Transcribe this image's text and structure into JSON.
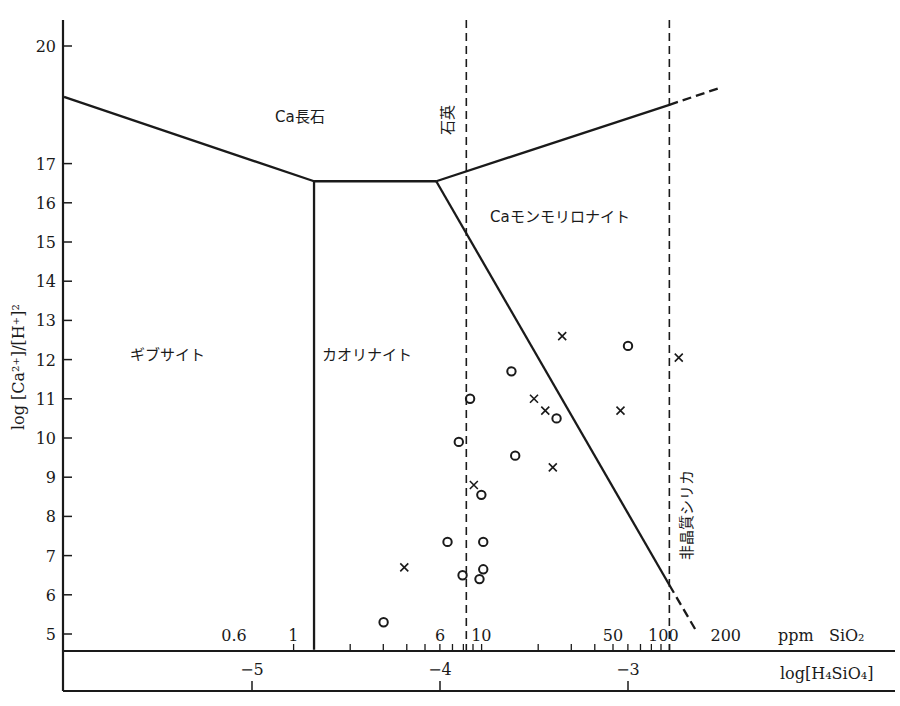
{
  "chart_data": {
    "type": "scatter",
    "title": "",
    "xlabel": "log[H4SiO4]",
    "xlabel_secondary": "ppm SiO2",
    "ylabel": "log [Ca2+]/[H+]2",
    "xlim": [
      -6.0,
      -2.2
    ],
    "ylim": [
      4.6,
      20.6
    ],
    "grid": false,
    "y_ticks": [
      20,
      17,
      16,
      15,
      14,
      13,
      12,
      11,
      10,
      9,
      8,
      7,
      6,
      5
    ],
    "x_ticks_log": [
      {
        "value": -5,
        "label": "−5"
      },
      {
        "value": -4,
        "label": "−4"
      },
      {
        "value": -3,
        "label": "−3"
      }
    ],
    "x_ticks_ppm": [
      {
        "label": "0.6",
        "x_log": -5.0
      },
      {
        "label": "1",
        "x_log": -4.78
      },
      {
        "label": "6",
        "x_log": -4.0
      },
      {
        "label": "10",
        "x_log": -3.78
      },
      {
        "label": "50",
        "x_log": -3.08
      },
      {
        "label": "100",
        "x_log": -2.78
      },
      {
        "label": "200",
        "x_log": -2.48
      }
    ],
    "regions": [
      {
        "name": "Ca長石",
        "label": "Ca長石"
      },
      {
        "name": "ギブサイト",
        "label": "ギブサイト"
      },
      {
        "name": "カオリナイト",
        "label": "カオリナイト"
      },
      {
        "name": "Caモンモリロナイト",
        "label": "Caモンモリロナイト"
      }
    ],
    "boundary_lines": [
      {
        "name": "feldspar-gibbsite",
        "points": [
          [
            -6.0,
            18.7
          ],
          [
            -4.67,
            16.55
          ]
        ]
      },
      {
        "name": "gibbsite-kaolinite",
        "points": [
          [
            -4.67,
            16.55
          ],
          [
            -4.67,
            4.6
          ]
        ]
      },
      {
        "name": "feldspar-kaolinite",
        "points": [
          [
            -4.67,
            16.55
          ],
          [
            -4.02,
            16.55
          ]
        ]
      },
      {
        "name": "feldspar-montmorillonite",
        "points": [
          [
            -4.02,
            16.55
          ],
          [
            -2.78,
            18.5
          ]
        ],
        "dashed_extension": [
          [
            -2.78,
            18.5
          ],
          [
            -2.5,
            18.95
          ]
        ]
      },
      {
        "name": "kaolinite-montmorillonite",
        "points": [
          [
            -4.02,
            16.55
          ],
          [
            -2.78,
            6.25
          ]
        ],
        "dashed_extension": [
          [
            -2.78,
            6.25
          ],
          [
            -2.64,
            5.1
          ]
        ]
      }
    ],
    "reference_lines": [
      {
        "name": "石英",
        "label": "石英",
        "x_log": -3.86,
        "style": "dashed"
      },
      {
        "name": "非晶質シリカ",
        "label": "非晶質シリカ",
        "x_log": -2.78,
        "style": "dashed"
      }
    ],
    "series": [
      {
        "name": "circles",
        "marker": "o",
        "points": [
          [
            -4.3,
            5.3
          ],
          [
            -3.96,
            7.35
          ],
          [
            -3.9,
            9.9
          ],
          [
            -3.88,
            6.5
          ],
          [
            -3.84,
            11.0
          ],
          [
            -3.78,
            8.55
          ],
          [
            -3.77,
            7.35
          ],
          [
            -3.77,
            6.65
          ],
          [
            -3.79,
            6.4
          ],
          [
            -3.62,
            11.7
          ],
          [
            -3.6,
            9.55
          ],
          [
            -3.38,
            10.5
          ],
          [
            -3.0,
            12.35
          ]
        ]
      },
      {
        "name": "crosses",
        "marker": "x",
        "points": [
          [
            -4.19,
            6.7
          ],
          [
            -3.82,
            8.8
          ],
          [
            -3.5,
            11.0
          ],
          [
            -3.44,
            10.7
          ],
          [
            -3.4,
            9.25
          ],
          [
            -3.35,
            12.6
          ],
          [
            -3.04,
            10.7
          ],
          [
            -2.73,
            12.05
          ]
        ]
      }
    ]
  },
  "labels": {
    "y_axis": "log [Ca²⁺]/[H⁺]²",
    "x_axis_ppm": "ppm   SiO₂",
    "x_axis_log": "log[H₄SiO₄]",
    "region_feldspar": "Ca長石",
    "region_gibbsite": "ギブサイト",
    "region_kaolinite": "カオリナイト",
    "region_montmorillonite": "Caモンモリロナイト",
    "quartz": "石英",
    "amorphous_silica": "非晶質シリカ"
  }
}
